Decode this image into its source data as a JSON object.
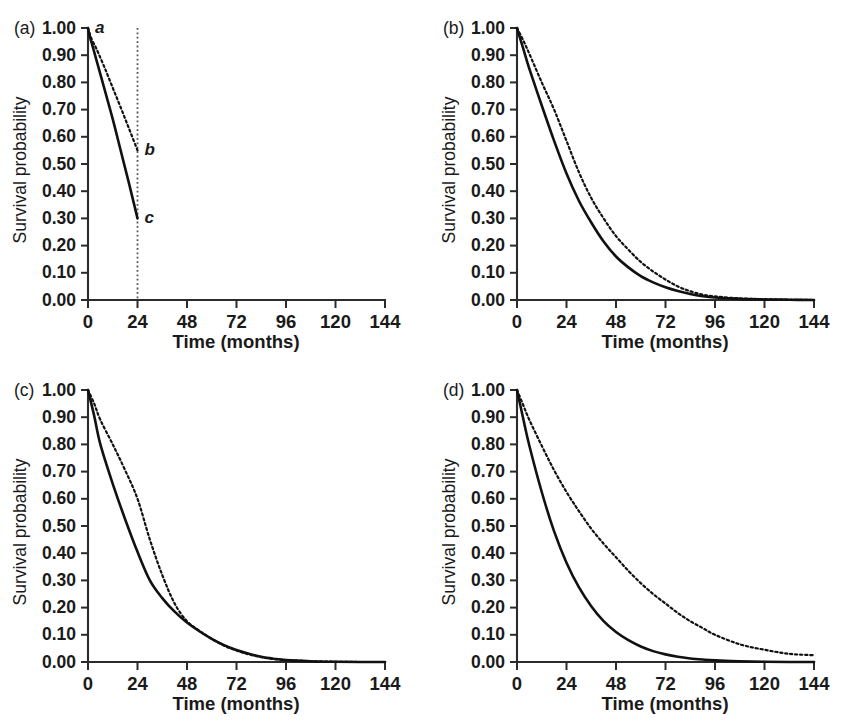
{
  "figure": {
    "background": "#ffffff",
    "ink_color": "#111111",
    "panel_count": 4
  },
  "axes_common": {
    "xlabel": "Time (months)",
    "ylabel": "Survival probability",
    "xticks": [
      0,
      24,
      48,
      72,
      96,
      120,
      144
    ],
    "xtick_labels": [
      "0",
      "24",
      "48",
      "72",
      "96",
      "120",
      "144"
    ],
    "yticks": [
      0.0,
      0.1,
      0.2,
      0.3,
      0.4,
      0.5,
      0.6,
      0.7,
      0.8,
      0.9,
      1.0
    ],
    "ytick_labels": [
      "0.00",
      "0.10",
      "0.20",
      "0.30",
      "0.40",
      "0.50",
      "0.60",
      "0.70",
      "0.80",
      "0.90",
      "1.00"
    ],
    "xlim": [
      0,
      144
    ],
    "ylim": [
      0.0,
      1.0
    ],
    "grid": false,
    "legend": "none"
  },
  "chart_data": [
    {
      "id": "panel-a",
      "type": "line",
      "panel_label": "(a)",
      "title": "",
      "xlabel": "Time (months)",
      "ylabel": "Survival probability",
      "xlim": [
        0,
        144
      ],
      "ylim": [
        0.0,
        1.0
      ],
      "grid": false,
      "annotations": [
        {
          "text": "a",
          "x": 0,
          "y": 1.0,
          "style": "italic"
        },
        {
          "text": "b",
          "x": 24,
          "y": 0.55,
          "style": "italic"
        },
        {
          "text": "c",
          "x": 24,
          "y": 0.3,
          "style": "italic"
        }
      ],
      "reference_lines": [
        {
          "orientation": "vertical",
          "x": 24,
          "style": "dotted",
          "from_y": 0.0,
          "to_y": 1.0
        }
      ],
      "series": [
        {
          "name": "dotted-upper",
          "style": "dotted",
          "x": [
            0,
            1,
            2,
            4,
            8,
            12,
            16,
            20,
            24
          ],
          "values": [
            1.0,
            0.975,
            0.955,
            0.925,
            0.855,
            0.78,
            0.705,
            0.628,
            0.55
          ]
        },
        {
          "name": "solid-lower",
          "style": "solid",
          "x": [
            0,
            1,
            2,
            4,
            8,
            12,
            16,
            20,
            24
          ],
          "values": [
            1.0,
            0.965,
            0.94,
            0.885,
            0.775,
            0.665,
            0.545,
            0.425,
            0.3
          ]
        }
      ]
    },
    {
      "id": "panel-b",
      "type": "line",
      "panel_label": "(b)",
      "title": "",
      "xlabel": "Time (months)",
      "ylabel": "Survival probability",
      "xlim": [
        0,
        144
      ],
      "ylim": [
        0.0,
        1.0
      ],
      "grid": false,
      "annotations": [],
      "reference_lines": [],
      "series": [
        {
          "name": "dotted-upper",
          "style": "dotted",
          "x": [
            0,
            3,
            6,
            12,
            18,
            24,
            30,
            36,
            42,
            48,
            54,
            60,
            66,
            72,
            78,
            84,
            90,
            96,
            108,
            120,
            132,
            144
          ],
          "values": [
            1.0,
            0.955,
            0.905,
            0.8,
            0.7,
            0.585,
            0.47,
            0.375,
            0.3,
            0.235,
            0.185,
            0.14,
            0.105,
            0.075,
            0.05,
            0.032,
            0.02,
            0.013,
            0.006,
            0.003,
            0.001,
            0.0
          ]
        },
        {
          "name": "solid-lower",
          "style": "solid",
          "x": [
            0,
            3,
            6,
            12,
            18,
            24,
            30,
            36,
            42,
            48,
            54,
            60,
            66,
            72,
            78,
            84,
            90,
            96,
            108,
            120,
            132,
            144
          ],
          "values": [
            1.0,
            0.925,
            0.85,
            0.715,
            0.585,
            0.465,
            0.365,
            0.285,
            0.215,
            0.16,
            0.12,
            0.088,
            0.065,
            0.047,
            0.033,
            0.022,
            0.014,
            0.009,
            0.004,
            0.002,
            0.001,
            0.0
          ]
        }
      ]
    },
    {
      "id": "panel-c",
      "type": "line",
      "panel_label": "(c)",
      "title": "",
      "xlabel": "Time (months)",
      "ylabel": "Survival probability",
      "xlim": [
        0,
        144
      ],
      "ylim": [
        0.0,
        1.0
      ],
      "grid": false,
      "annotations": [],
      "reference_lines": [],
      "series": [
        {
          "name": "dotted-upper",
          "style": "dotted",
          "x": [
            0,
            3,
            6,
            12,
            18,
            24,
            30,
            36,
            42,
            48,
            54,
            60,
            66,
            72,
            78,
            84,
            90,
            96,
            108,
            120,
            132,
            144
          ],
          "values": [
            1.0,
            0.95,
            0.89,
            0.8,
            0.705,
            0.6,
            0.45,
            0.32,
            0.215,
            0.15,
            0.115,
            0.085,
            0.06,
            0.042,
            0.028,
            0.018,
            0.011,
            0.007,
            0.003,
            0.001,
            0.0,
            0.0
          ]
        },
        {
          "name": "solid-lower",
          "style": "solid",
          "x": [
            0,
            3,
            6,
            12,
            18,
            24,
            30,
            36,
            42,
            48,
            54,
            60,
            66,
            72,
            78,
            84,
            90,
            96,
            108,
            120,
            132,
            144
          ],
          "values": [
            1.0,
            0.905,
            0.8,
            0.655,
            0.525,
            0.405,
            0.3,
            0.235,
            0.185,
            0.145,
            0.113,
            0.085,
            0.062,
            0.044,
            0.03,
            0.019,
            0.012,
            0.007,
            0.003,
            0.001,
            0.0,
            0.0
          ]
        }
      ]
    },
    {
      "id": "panel-d",
      "type": "line",
      "panel_label": "(d)",
      "title": "",
      "xlabel": "Time (months)",
      "ylabel": "Survival probability",
      "xlim": [
        0,
        144
      ],
      "ylim": [
        0.0,
        1.0
      ],
      "grid": false,
      "annotations": [],
      "reference_lines": [],
      "series": [
        {
          "name": "dotted-upper",
          "style": "dotted",
          "x": [
            0,
            3,
            6,
            12,
            18,
            24,
            30,
            36,
            42,
            48,
            54,
            60,
            66,
            72,
            78,
            84,
            90,
            96,
            108,
            120,
            132,
            144
          ],
          "values": [
            1.0,
            0.945,
            0.89,
            0.795,
            0.705,
            0.625,
            0.555,
            0.49,
            0.435,
            0.385,
            0.335,
            0.29,
            0.25,
            0.215,
            0.18,
            0.15,
            0.125,
            0.1,
            0.065,
            0.045,
            0.03,
            0.025
          ]
        },
        {
          "name": "solid-lower",
          "style": "solid",
          "x": [
            0,
            3,
            6,
            12,
            18,
            24,
            30,
            36,
            42,
            48,
            54,
            60,
            66,
            72,
            78,
            84,
            90,
            96,
            108,
            120,
            132,
            144
          ],
          "values": [
            1.0,
            0.895,
            0.795,
            0.625,
            0.48,
            0.365,
            0.275,
            0.205,
            0.15,
            0.11,
            0.08,
            0.057,
            0.04,
            0.028,
            0.019,
            0.013,
            0.009,
            0.006,
            0.003,
            0.001,
            0.0,
            0.0
          ]
        }
      ]
    }
  ]
}
